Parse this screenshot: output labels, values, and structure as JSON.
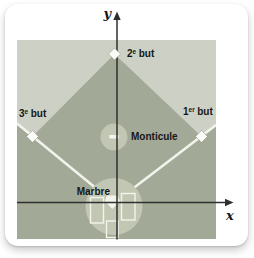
{
  "diagram": {
    "type": "baseball-field-coordinate-diagram",
    "axes": {
      "x_label": "x",
      "y_label": "y"
    },
    "labels": {
      "second_base": {
        "num": "2",
        "sup": "e",
        "word": "but"
      },
      "third_base": {
        "num": "3",
        "sup": "e",
        "word": "but"
      },
      "first_base": {
        "num": "1",
        "sup": "er",
        "word": "but"
      },
      "mound": "Monticule",
      "home_plate": "Marbre"
    },
    "colors": {
      "card_bg": "#ffffff",
      "outfield_light": "#cdd1c5",
      "infield_dark": "#a3a997",
      "circle_fill": "#c2c7b4",
      "line_white": "#f2f4ec",
      "axis_color": "#2f2f2f",
      "marker_fill": "#fbfcf8",
      "marker_stroke": "#6e7465",
      "text_color": "#161616"
    }
  }
}
